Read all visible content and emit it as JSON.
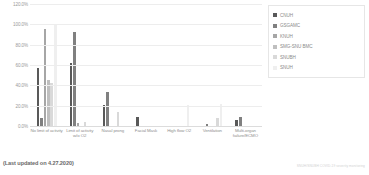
{
  "footer": {
    "note": "(Last updated on 4.27.2020)",
    "credit": "SNUH/SNUBH COVID-19 severity monitoring"
  },
  "legend": {
    "position": "top-right",
    "items": [
      {
        "label": "CNUH",
        "color": "#595959"
      },
      {
        "label": "GSGAMC",
        "color": "#808080"
      },
      {
        "label": "KNUH",
        "color": "#a6a6a6"
      },
      {
        "label": "SMG-SNU BMC",
        "color": "#bfbfbf"
      },
      {
        "label": "SNUBH",
        "color": "#d9d9d9"
      },
      {
        "label": "SNUH",
        "color": "#efefef"
      }
    ]
  },
  "chart_data": {
    "type": "bar",
    "title": "",
    "xlabel": "",
    "ylabel": "",
    "ylim": [
      0,
      120
    ],
    "ytick_labels": [
      "120.0%",
      "100.0%",
      "80.0%",
      "60.0%",
      "40.0%",
      "20.0%",
      "0.0%"
    ],
    "ytick_values": [
      120,
      100,
      80,
      60,
      40,
      20,
      0
    ],
    "grid": true,
    "categories": [
      "No limit of activity",
      "Limit of activity w/o O2",
      "Nasal prong",
      "Facial Mask",
      "High flow O2",
      "Ventilation",
      "Multi-organ failure/ECMO"
    ],
    "series": [
      {
        "name": "CNUH",
        "color": "#595959",
        "values": [
          57.0,
          62.0,
          21.0,
          9.0,
          0.0,
          0.0,
          6.0
        ]
      },
      {
        "name": "GSGAMC",
        "color": "#808080",
        "values": [
          8.0,
          92.0,
          33.0,
          0.0,
          0.0,
          2.0,
          9.0
        ]
      },
      {
        "name": "KNUH",
        "color": "#a6a6a6",
        "values": [
          95.0,
          3.0,
          0.0,
          0.0,
          0.0,
          0.0,
          0.0
        ]
      },
      {
        "name": "SMG-SNU BMC",
        "color": "#bfbfbf",
        "values": [
          45.0,
          0.0,
          0.0,
          0.0,
          0.0,
          0.0,
          0.0
        ]
      },
      {
        "name": "SNUBH",
        "color": "#d9d9d9",
        "values": [
          42.0,
          4.0,
          14.0,
          0.0,
          0.0,
          8.0,
          0.0
        ]
      },
      {
        "name": "SNUH",
        "color": "#efefef",
        "values": [
          99.0,
          0.0,
          0.0,
          0.0,
          21.0,
          22.0,
          0.0
        ]
      }
    ]
  }
}
